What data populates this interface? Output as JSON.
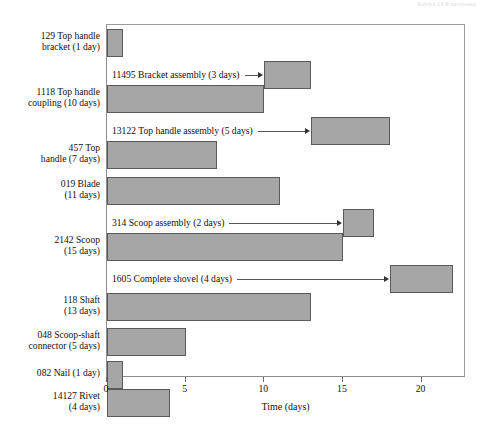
{
  "header": {
    "artifact_text": "Exhibit 13-8 continued"
  },
  "chart_data": {
    "type": "bar",
    "subtype": "gantt",
    "title": "",
    "xlabel": "Time (days)",
    "ylabel": "",
    "xlim": [
      0,
      22.8
    ],
    "xticks": [
      0,
      5,
      10,
      15,
      20
    ],
    "xticklabels": [
      "0",
      "5",
      "10",
      "15",
      "20"
    ],
    "grid": false,
    "legend": "none",
    "bar_fill_color": "#a6a6a6",
    "bar_edge_color": "#5a5a5a",
    "categories": [
      "129 Top handle bracket (1 day)",
      "11495 Bracket assembly (3 days)",
      "1118 Top handle coupling (10 days)",
      "13122 Top handle assembly (5 days)",
      "457 Top handle (7 days)",
      "019 Blade (11 days)",
      "314 Scoop assembly (2 days)",
      "2142 Scoop (15 days)",
      "1605 Complete shovel (4 days)",
      "118 Shaft (13 days)",
      "048 Scoop-shaft connector (5 days)",
      "082 Nail (1 day)",
      "14127 Rivet (4 days)"
    ],
    "tasks": [
      {
        "id": "129",
        "name": "Top handle bracket",
        "label_lines": [
          "129 Top handle",
          "bracket (1 day)"
        ],
        "duration_days": 1,
        "start_day": 0,
        "end_day": 1,
        "label_style": "axis"
      },
      {
        "id": "11495",
        "name": "Bracket assembly",
        "label_lines": [
          "11495 Bracket assembly (3 days)"
        ],
        "duration_days": 3,
        "start_day": 10,
        "end_day": 13,
        "label_style": "annotation"
      },
      {
        "id": "1118",
        "name": "Top handle coupling",
        "label_lines": [
          "1118 Top handle",
          "coupling (10 days)"
        ],
        "duration_days": 10,
        "start_day": 0,
        "end_day": 10,
        "label_style": "axis"
      },
      {
        "id": "13122",
        "name": "Top handle assembly",
        "label_lines": [
          "13122 Top handle assembly (5 days)"
        ],
        "duration_days": 5,
        "start_day": 13,
        "end_day": 18,
        "label_style": "annotation"
      },
      {
        "id": "457",
        "name": "Top handle",
        "label_lines": [
          "457 Top",
          "handle (7 days)"
        ],
        "duration_days": 7,
        "start_day": 0,
        "end_day": 7,
        "label_style": "axis"
      },
      {
        "id": "019",
        "name": "Blade",
        "label_lines": [
          "019 Blade",
          "(11 days)"
        ],
        "duration_days": 11,
        "start_day": 0,
        "end_day": 11,
        "label_style": "axis"
      },
      {
        "id": "314",
        "name": "Scoop assembly",
        "label_lines": [
          "314 Scoop assembly (2 days)"
        ],
        "duration_days": 2,
        "start_day": 15,
        "end_day": 17,
        "label_style": "annotation"
      },
      {
        "id": "2142",
        "name": "Scoop",
        "label_lines": [
          "2142 Scoop",
          "(15 days)"
        ],
        "duration_days": 15,
        "start_day": 0,
        "end_day": 15,
        "label_style": "axis"
      },
      {
        "id": "1605",
        "name": "Complete shovel",
        "label_lines": [
          "1605 Complete shovel (4 days)"
        ],
        "duration_days": 4,
        "start_day": 18,
        "end_day": 22,
        "label_style": "annotation"
      },
      {
        "id": "118",
        "name": "Shaft",
        "label_lines": [
          "118 Shaft",
          "(13 days)"
        ],
        "duration_days": 13,
        "start_day": 0,
        "end_day": 13,
        "label_style": "axis"
      },
      {
        "id": "048",
        "name": "Scoop-shaft connector",
        "label_lines": [
          "048 Scoop-shaft",
          "connector (5 days)"
        ],
        "duration_days": 5,
        "start_day": 0,
        "end_day": 5,
        "label_style": "axis"
      },
      {
        "id": "082",
        "name": "Nail",
        "label_lines": [
          "082 Nail (1 day)"
        ],
        "duration_days": 1,
        "start_day": 0,
        "end_day": 1,
        "label_style": "axis"
      },
      {
        "id": "14127",
        "name": "Rivet",
        "label_lines": [
          "14127 Rivet",
          "(4 days)"
        ],
        "duration_days": 4,
        "start_day": 0,
        "end_day": 4,
        "label_style": "axis"
      }
    ]
  },
  "axis_labels": {
    "row_0": "129 Top handle\nbracket (1 day)",
    "row_2": "1118 Top handle\ncoupling (10 days)",
    "row_4": "457 Top\nhandle (7 days)",
    "row_5": "019 Blade\n(11 days)",
    "row_7": "2142 Scoop\n(15 days)",
    "row_9": "118 Shaft\n(13 days)",
    "row_10": "048 Scoop-shaft\nconnector (5 days)",
    "row_11": "082 Nail (1 day)",
    "row_12": "14127 Rivet\n(4 days)"
  },
  "annotations": {
    "ann_1": "11495 Bracket assembly (3 days)",
    "ann_3": "13122 Top handle assembly (5 days)",
    "ann_6": "314 Scoop assembly (2 days)",
    "ann_8": "1605 Complete shovel (4 days)"
  }
}
